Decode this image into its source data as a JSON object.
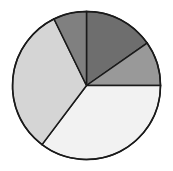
{
  "chart_data": {
    "type": "pie",
    "title": "",
    "xlabel": "",
    "ylabel": "",
    "legend": "none",
    "grid": false,
    "start_angle_deg": 0,
    "direction": "clockwise",
    "center": {
      "x": 86.5,
      "y": 85.5
    },
    "radius": 74,
    "outline_color": "#1a1a1a",
    "outline_width": 1.5,
    "background": "#ffffff",
    "labels": [
      "Slice 1",
      "Slice 2",
      "Slice 3",
      "Slice 4",
      "Slice 5"
    ],
    "values": [
      15.3,
      9.7,
      35.3,
      32.5,
      7.2
    ],
    "angles_deg": [
      55,
      35,
      127,
      117,
      26
    ],
    "colors": [
      "#6e6e6e",
      "#999999",
      "#f2f2f2",
      "#d5d5d5",
      "#808080"
    ],
    "slices": [
      {
        "name": "Slice 1",
        "color": "#6e6e6e",
        "value": 15.3,
        "angle_deg": 55,
        "start_deg": 0,
        "end_deg": 55
      },
      {
        "name": "Slice 2",
        "color": "#999999",
        "value": 9.7,
        "angle_deg": 35,
        "start_deg": 55,
        "end_deg": 90
      },
      {
        "name": "Slice 3",
        "color": "#f2f2f2",
        "value": 35.3,
        "angle_deg": 127,
        "start_deg": 90,
        "end_deg": 217
      },
      {
        "name": "Slice 4",
        "color": "#d5d5d5",
        "value": 32.5,
        "angle_deg": 117,
        "start_deg": 217,
        "end_deg": 334
      },
      {
        "name": "Slice 5",
        "color": "#808080",
        "value": 7.2,
        "angle_deg": 26,
        "start_deg": 334,
        "end_deg": 360
      }
    ]
  }
}
